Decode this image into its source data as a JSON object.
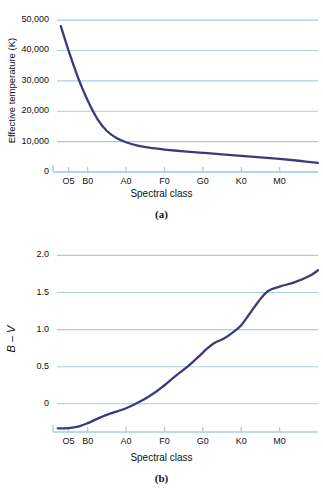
{
  "figure": {
    "panels": [
      {
        "caption": "(a)",
        "ylabel": "Effective temperature (K)",
        "xlabel": "Spectral class"
      },
      {
        "caption": "(b)",
        "ylabel": "B – V",
        "xlabel": "Spectral class"
      }
    ]
  },
  "colors": {
    "curve": "#3b3b7a",
    "gridline": "#a8cce4",
    "axis": "#a8cce4",
    "text": "#111111",
    "background": "#ffffff"
  },
  "chart_data": [
    {
      "type": "line",
      "title": "",
      "panel": "(a)",
      "xlabel": "Spectral class",
      "ylabel": "Effective temperature (K)",
      "grid": true,
      "legend": null,
      "xticklabels": [
        "O5",
        "B0",
        "A0",
        "F0",
        "G0",
        "K0",
        "M0"
      ],
      "xtickvalues": [
        0.5,
        1.0,
        2.0,
        3.0,
        4.0,
        5.0,
        6.0
      ],
      "xlim": [
        0.2,
        7.0
      ],
      "yticklabels": [
        "0",
        "10,000",
        "20,000",
        "30,000",
        "40,000",
        "50,000"
      ],
      "ytickvalues": [
        0,
        10000,
        20000,
        30000,
        40000,
        50000
      ],
      "ylim": [
        0,
        52000
      ],
      "series": [
        {
          "name": "Effective temperature",
          "x": [
            0.3,
            0.5,
            0.75,
            1.0,
            1.25,
            1.5,
            1.75,
            2.0,
            2.3,
            2.6,
            3.0,
            3.5,
            4.0,
            4.5,
            5.0,
            5.5,
            6.0,
            6.5,
            7.0
          ],
          "values": [
            48000,
            40000,
            31000,
            23500,
            17500,
            13500,
            11200,
            9800,
            8700,
            8000,
            7400,
            6800,
            6300,
            5800,
            5300,
            4800,
            4300,
            3700,
            3000
          ]
        }
      ]
    },
    {
      "type": "line",
      "title": "",
      "panel": "(b)",
      "xlabel": "Spectral class",
      "ylabel": "B – V",
      "grid": true,
      "legend": null,
      "xticklabels": [
        "O5",
        "B0",
        "A0",
        "F0",
        "G0",
        "K0",
        "M0"
      ],
      "xtickvalues": [
        0.5,
        1.0,
        2.0,
        3.0,
        4.0,
        5.0,
        6.0
      ],
      "xlim": [
        0.2,
        7.0
      ],
      "yticklabels": [
        "0",
        "0.5",
        "1.0",
        "1.5",
        "2.0"
      ],
      "ytickvalues": [
        0,
        0.5,
        1.0,
        1.5,
        2.0
      ],
      "ylim": [
        -0.38,
        2.1
      ],
      "series": [
        {
          "name": "B minus V color index",
          "x": [
            0.22,
            0.4,
            0.6,
            0.8,
            1.0,
            1.3,
            1.6,
            2.0,
            2.4,
            2.8,
            3.0,
            3.3,
            3.6,
            3.9,
            4.1,
            4.3,
            4.55,
            4.8,
            5.0,
            5.2,
            5.45,
            5.7,
            6.0,
            6.4,
            6.8,
            7.0
          ],
          "values": [
            -0.33,
            -0.33,
            -0.32,
            -0.3,
            -0.26,
            -0.19,
            -0.13,
            -0.06,
            0.04,
            0.17,
            0.25,
            0.38,
            0.5,
            0.64,
            0.74,
            0.82,
            0.88,
            0.97,
            1.06,
            1.2,
            1.38,
            1.52,
            1.58,
            1.64,
            1.73,
            1.8
          ]
        }
      ]
    }
  ]
}
